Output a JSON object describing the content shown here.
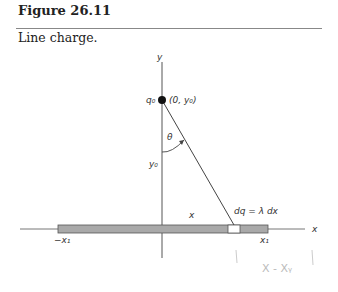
{
  "figure": {
    "title": "Figure 26.11",
    "caption": "Line charge."
  },
  "diagram": {
    "labels": {
      "y_axis": "y",
      "x_axis": "x",
      "charge": "q₀",
      "point": "(0, y₀)",
      "angle": "θ",
      "distance": "y₀",
      "position": "x",
      "element": "dq = λ dx",
      "left_end": "−x₁",
      "right_end": "x₁"
    },
    "annotations": {
      "handwritten": "X - Xᵧ"
    },
    "colors": {
      "rod": "#a9a9a9",
      "element": "#ffffff",
      "axis": "#555555"
    }
  }
}
